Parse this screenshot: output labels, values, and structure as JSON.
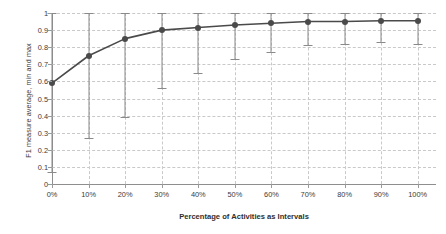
{
  "chart_data": {
    "type": "line",
    "title": "",
    "xlabel": "Percentage of Activities as Intervals",
    "ylabel": "F1 measure average, min and max",
    "categories": [
      "0%",
      "10%",
      "20%",
      "30%",
      "40%",
      "50%",
      "60%",
      "70%",
      "80%",
      "90%",
      "100%"
    ],
    "x": [
      0,
      10,
      20,
      30,
      40,
      50,
      60,
      70,
      80,
      90,
      100
    ],
    "xlim": [
      0,
      105
    ],
    "ylim": [
      0,
      1
    ],
    "ytick_labels": [
      "0",
      "0.1",
      "0.2",
      "0.3",
      "0.4",
      "0.5",
      "0.6",
      "0.7",
      "0.8",
      "0.9",
      "1"
    ],
    "ytick_values": [
      0,
      0.1,
      0.2,
      0.3,
      0.4,
      0.5,
      0.6,
      0.7,
      0.8,
      0.9,
      1
    ],
    "grid": true,
    "legend": "none",
    "series": [
      {
        "name": "F1 measure average",
        "values": [
          0.59,
          0.75,
          0.85,
          0.9,
          0.915,
          0.93,
          0.94,
          0.95,
          0.95,
          0.955,
          0.955
        ]
      },
      {
        "name": "min",
        "values": [
          0.07,
          0.27,
          0.39,
          0.56,
          0.65,
          0.73,
          0.77,
          0.81,
          0.82,
          0.83,
          0.82
        ]
      },
      {
        "name": "max",
        "values": [
          1.0,
          1.0,
          1.0,
          1.0,
          1.0,
          1.0,
          1.0,
          1.0,
          1.0,
          1.0,
          1.0
        ]
      }
    ],
    "colors": {
      "line": "#4a4a4a",
      "marker": "#4a4a4a",
      "errorbar": "#8a8a8a",
      "grid": "#c9c9c9",
      "axis": "#8e8e8e"
    }
  }
}
